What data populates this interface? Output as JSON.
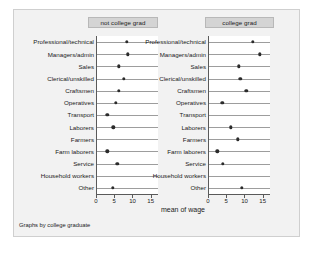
{
  "figure": {
    "xaxis_title": "mean of wage",
    "footnote": "Graphs by college graduate",
    "background": "#f2f2f2",
    "marker_color": "#2b2b2b",
    "panel_title_bg": "#d4d4d4"
  },
  "chart_data": {
    "type": "scatter",
    "title": "",
    "subtitle": "",
    "xlabel": "mean of wage",
    "ylabel": "",
    "note": "Graphs by college graduate",
    "xlim": [
      0,
      17
    ],
    "xticks": [
      0,
      5,
      10,
      15
    ],
    "xticklabels": [
      "0",
      "5",
      "10",
      "15"
    ],
    "grid": "horizontal category rules",
    "legend": "none",
    "panel_variable": "college graduate",
    "categories": [
      "Professional/technical",
      "Managers/admin",
      "Sales",
      "Clerical/unskilled",
      "Craftsmen",
      "Operatives",
      "Transport",
      "Laborers",
      "Farmers",
      "Farm laborers",
      "Service",
      "Household workers",
      "Other"
    ],
    "panels": [
      {
        "name": "not college grad",
        "values": [
          8.2,
          8.5,
          6.0,
          7.4,
          6.0,
          5.2,
          2.8,
          4.5,
          null,
          2.8,
          5.6,
          null,
          4.3
        ]
      },
      {
        "name": "college grad",
        "values": [
          12.0,
          14.0,
          8.2,
          8.6,
          10.2,
          3.7,
          null,
          6.0,
          7.9,
          2.3,
          3.8,
          null,
          9.0
        ]
      }
    ]
  }
}
